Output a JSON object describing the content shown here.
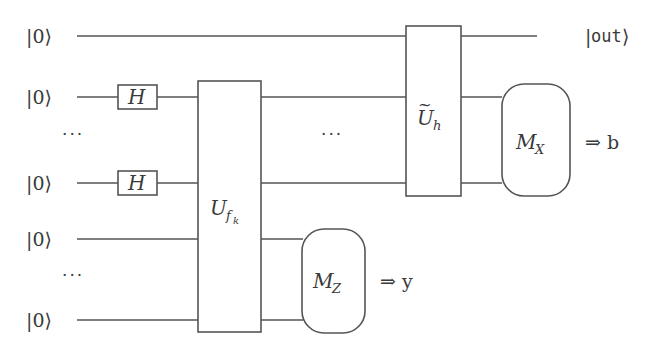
{
  "diagram": {
    "type": "quantum-circuit",
    "inputs": [
      {
        "label": "|0⟩",
        "y": 36
      },
      {
        "label": "|0⟩",
        "y": 97
      },
      {
        "label": "···",
        "y": 136
      },
      {
        "label": "|0⟩",
        "y": 183
      },
      {
        "label": "|0⟩",
        "y": 239
      },
      {
        "label": "···",
        "y": 277
      },
      {
        "label": "|0⟩",
        "y": 320
      }
    ],
    "gates": {
      "h1": {
        "label": "H"
      },
      "h2": {
        "label": "H"
      },
      "ufk": {
        "label": "U",
        "sub": "f",
        "subsub": "k"
      },
      "uh": {
        "label": "U",
        "tilde": "~",
        "sub": "h"
      },
      "mz": {
        "label": "M",
        "sub": "Z"
      },
      "mx": {
        "label": "M",
        "sub": "X"
      }
    },
    "middle_dots": "···",
    "outputs": {
      "out_ket_open": "|",
      "out_text": "out",
      "out_ket_close": "⟩",
      "mx_result": "⇒ b",
      "mz_result": "⇒ y"
    }
  }
}
